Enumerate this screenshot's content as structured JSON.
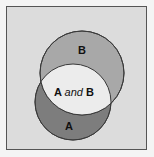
{
  "diagram": {
    "type": "venn",
    "colors": {
      "background": "#dcdcdc",
      "border": "#555555",
      "set_a": "#7d7d7d",
      "set_b": "#a8a8a8",
      "intersection": "#ececec",
      "outline": "#3a3a3a"
    },
    "sets": [
      {
        "id": "A",
        "label": "A"
      },
      {
        "id": "B",
        "label": "B"
      }
    ],
    "intersection": {
      "label_a": "A",
      "label_and": "and",
      "label_b": "B"
    }
  }
}
